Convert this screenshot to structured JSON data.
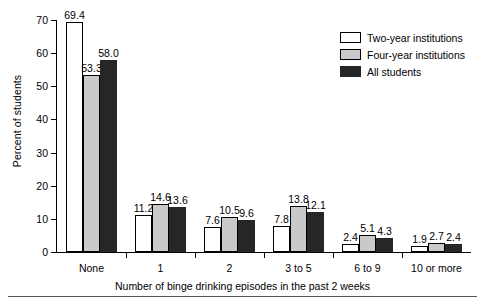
{
  "chart_data": {
    "type": "bar",
    "title": "",
    "subtitle": "",
    "xlabel": "Number of binge drinking episodes in the past 2 weeks",
    "ylabel": "Percent of students",
    "categories": [
      "None",
      "1",
      "2",
      "3 to 5",
      "6 to 9",
      "10 or more"
    ],
    "series": [
      {
        "name": "Two-year institutions",
        "values": [
          69.4,
          11.2,
          7.6,
          7.8,
          2.4,
          1.9
        ],
        "color": "#ffffff"
      },
      {
        "name": "Four-year institutions",
        "values": [
          53.3,
          14.6,
          10.5,
          13.8,
          5.1,
          2.7
        ],
        "color": "#c9c9c9"
      },
      {
        "name": "All students",
        "values": [
          58.0,
          13.6,
          9.6,
          12.1,
          4.3,
          2.4
        ],
        "color": "#262626"
      }
    ],
    "ylim": [
      0,
      70
    ],
    "yticks": [
      0,
      10,
      20,
      30,
      40,
      50,
      60,
      70
    ],
    "ytick_labels": [
      "0",
      "10",
      "20",
      "30",
      "40",
      "50",
      "60",
      "70"
    ],
    "grid": false,
    "legend_position": "top-right",
    "data_labels": true,
    "value_label_format": "one-decimal"
  },
  "legend": {
    "items": [
      {
        "label": "Two-year institutions"
      },
      {
        "label": "Four-year institutions"
      },
      {
        "label": "All students"
      }
    ]
  },
  "axes": {
    "y_title": "Percent of students",
    "x_title": "Number of binge drinking episodes in the past 2 weeks"
  }
}
